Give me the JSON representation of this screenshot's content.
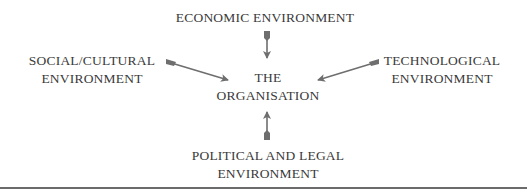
{
  "diagram": {
    "center": {
      "lines": [
        "THE",
        "ORGANISATION"
      ]
    },
    "nodes": {
      "top": {
        "lines": [
          "ECONOMIC ENVIRONMENT"
        ]
      },
      "left": {
        "lines": [
          "SOCIAL/CULTURAL",
          "ENVIRONMENT"
        ]
      },
      "right": {
        "lines": [
          "TECHNOLOGICAL",
          "ENVIRONMENT"
        ]
      },
      "bottom": {
        "lines": [
          "POLITICAL AND LEGAL",
          "ENVIRONMENT"
        ]
      }
    },
    "edges": [
      {
        "from": "ECONOMIC ENVIRONMENT",
        "to": "THE ORGANISATION"
      },
      {
        "from": "SOCIAL/CULTURAL ENVIRONMENT",
        "to": "THE ORGANISATION"
      },
      {
        "from": "TECHNOLOGICAL ENVIRONMENT",
        "to": "THE ORGANISATION"
      },
      {
        "from": "POLITICAL AND LEGAL ENVIRONMENT",
        "to": "THE ORGANISATION"
      }
    ],
    "colors": {
      "text": "#3a3a3a",
      "arrow": "#6e6e6e",
      "rule": "#6b6b6b"
    }
  }
}
